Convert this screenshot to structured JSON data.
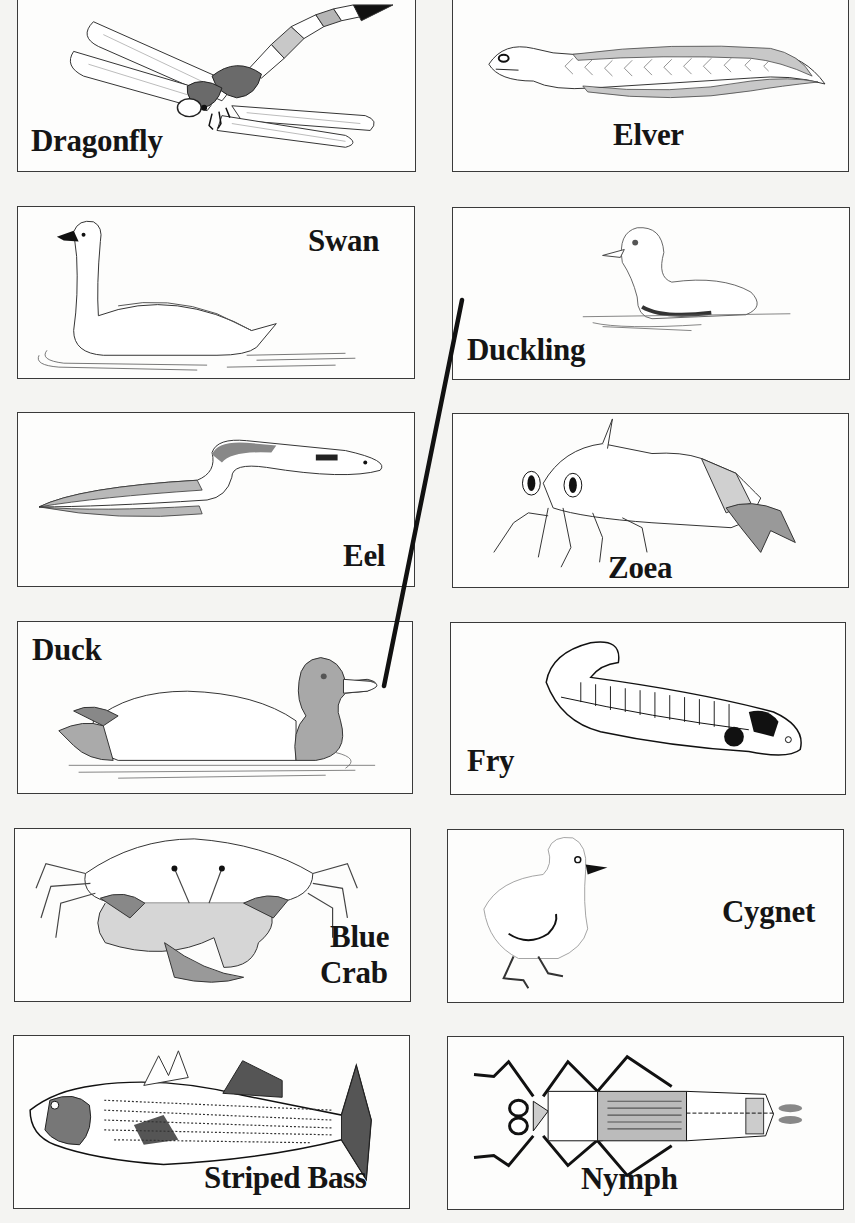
{
  "worksheet": {
    "cards": [
      {
        "id": "dragonfly",
        "label": "Dragonfly",
        "column": "left",
        "row": 1
      },
      {
        "id": "elver",
        "label": "Elver",
        "column": "right",
        "row": 1
      },
      {
        "id": "swan",
        "label": "Swan",
        "column": "left",
        "row": 2
      },
      {
        "id": "duckling",
        "label": "Duckling",
        "column": "right",
        "row": 2
      },
      {
        "id": "eel",
        "label": "Eel",
        "column": "left",
        "row": 3
      },
      {
        "id": "zoea",
        "label": "Zoea",
        "column": "right",
        "row": 3
      },
      {
        "id": "duck",
        "label": "Duck",
        "column": "left",
        "row": 4
      },
      {
        "id": "fry",
        "label": "Fry",
        "column": "right",
        "row": 4
      },
      {
        "id": "blue_crab",
        "label_line1": "Blue",
        "label_line2": "Crab",
        "column": "left",
        "row": 5
      },
      {
        "id": "cygnet",
        "label": "Cygnet",
        "column": "right",
        "row": 5
      },
      {
        "id": "striped_bass",
        "label": "Striped Bass",
        "column": "left",
        "row": 6
      },
      {
        "id": "nymph",
        "label": "Nymph",
        "column": "right",
        "row": 6
      }
    ],
    "drawn_match_lines": [
      {
        "from": "duck",
        "to": "duckling"
      }
    ],
    "colors": {
      "ink": "#151515",
      "border": "#3a3a3a",
      "shade_dark": "#8a8a8a",
      "shade_mid": "#b5b5b5",
      "shade_light": "#d6d6d6",
      "paper": "#fdfdfc"
    }
  }
}
